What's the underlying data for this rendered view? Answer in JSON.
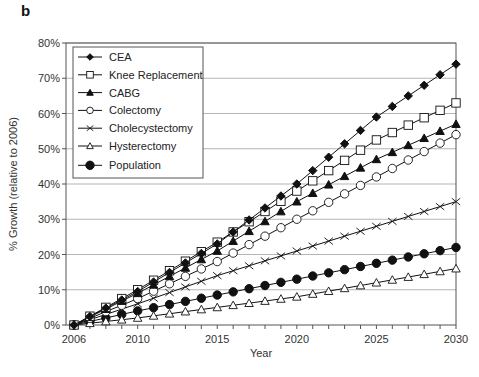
{
  "panel_label": "b",
  "chart_data": {
    "type": "line",
    "title": "",
    "xlabel": "Year",
    "ylabel": "% Growth (relative to 2006)",
    "xlim": [
      2006,
      2030
    ],
    "ylim": [
      0,
      80
    ],
    "x_ticks": [
      2006,
      2010,
      2015,
      2020,
      2025,
      2030
    ],
    "y_ticks": [
      "0%",
      "10%",
      "20%",
      "30%",
      "40%",
      "50%",
      "60%",
      "70%",
      "80%"
    ],
    "grid": "horizontal",
    "legend_position": "upper-left (inside)",
    "x": [
      2006,
      2007,
      2008,
      2009,
      2010,
      2011,
      2012,
      2013,
      2014,
      2015,
      2016,
      2017,
      2018,
      2019,
      2020,
      2021,
      2022,
      2023,
      2024,
      2025,
      2026,
      2027,
      2028,
      2029,
      2030
    ],
    "series": [
      {
        "name": "CEA",
        "marker": "diamond-filled",
        "values": [
          0,
          2.4,
          4.8,
          7.1,
          9.5,
          12.2,
          14.9,
          17.6,
          20.3,
          23,
          26.4,
          29.8,
          33.2,
          36.6,
          40,
          43.8,
          47.6,
          51.4,
          55.2,
          59,
          62,
          65,
          68,
          71,
          74
        ]
      },
      {
        "name": "Knee Replacement",
        "marker": "square-open",
        "values": [
          0,
          2.5,
          5,
          7.5,
          10,
          12.7,
          15.4,
          18.1,
          20.8,
          23.5,
          26.4,
          29.3,
          32.2,
          35.1,
          38,
          40.9,
          43.8,
          46.7,
          49.6,
          52.5,
          54.6,
          56.7,
          58.8,
          60.9,
          63
        ]
      },
      {
        "name": "CABG",
        "marker": "triangle-filled",
        "values": [
          0,
          2.3,
          4.5,
          6.8,
          9,
          11.4,
          13.8,
          16.2,
          18.6,
          21,
          23.8,
          26.6,
          29.4,
          32.2,
          35,
          37.4,
          39.8,
          42.2,
          44.6,
          47,
          49,
          51,
          53,
          55,
          57
        ]
      },
      {
        "name": "Colectomy",
        "marker": "circle-open",
        "values": [
          0,
          1.9,
          3.8,
          5.6,
          7.5,
          9.6,
          11.7,
          13.8,
          15.9,
          18,
          20.4,
          22.8,
          25.2,
          27.6,
          30,
          32.4,
          34.8,
          37.2,
          39.6,
          42,
          44.4,
          46.8,
          49.2,
          51.6,
          54
        ]
      },
      {
        "name": "Cholecystectomy",
        "marker": "x",
        "values": [
          0,
          1.5,
          3,
          4.5,
          6,
          7.6,
          9.2,
          10.8,
          12.4,
          14,
          15.4,
          16.8,
          18.2,
          19.6,
          21,
          22.4,
          23.8,
          25.2,
          26.6,
          28,
          29.4,
          30.8,
          32.2,
          33.6,
          35
        ]
      },
      {
        "name": "Hysterectomy",
        "marker": "triangle-open",
        "values": [
          0,
          0.5,
          1,
          1.5,
          2,
          2.6,
          3.2,
          3.8,
          4.4,
          5,
          5.6,
          6.2,
          6.8,
          7.4,
          8,
          8.8,
          9.6,
          10.4,
          11.2,
          12,
          12.8,
          13.6,
          14.4,
          15.2,
          16
        ]
      },
      {
        "name": "Population",
        "marker": "circle-filled",
        "values": [
          0,
          1,
          2,
          3,
          4,
          4.9,
          5.8,
          6.7,
          7.6,
          8.5,
          9.4,
          10.3,
          11.2,
          12.1,
          13,
          13.9,
          14.8,
          15.7,
          16.6,
          17.5,
          18.4,
          19.3,
          20.2,
          21.1,
          22
        ]
      }
    ]
  },
  "colors": {
    "line": "#111111",
    "grid": "#b5b5b5",
    "axis": "#555555",
    "background": "#ffffff"
  }
}
